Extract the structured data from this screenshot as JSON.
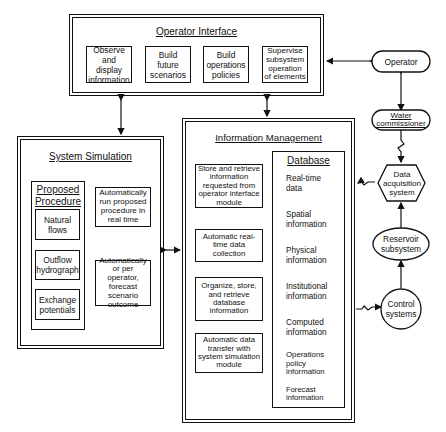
{
  "operator_interface": {
    "title": "Operator Interface",
    "boxes": [
      {
        "label": "Observe and display information"
      },
      {
        "label": "Build future scenarios"
      },
      {
        "label": "Build operations policies"
      },
      {
        "label": "Supervise subsystem operation of elements"
      }
    ]
  },
  "system_simulation": {
    "title": "System Simulation",
    "proposed_procedure": {
      "title_line1": "Proposed",
      "title_line2": "Procedure",
      "items": [
        {
          "label": "Natural flows"
        },
        {
          "label": "Outflow hydrograph"
        },
        {
          "label": "Exchange potentials"
        }
      ]
    },
    "actions": [
      {
        "label": "Automatically run proposed procedure in real time"
      },
      {
        "label": "Automatically or per operator, forecast scenario outcome"
      }
    ]
  },
  "information_management": {
    "title": "Information Management",
    "functions": [
      {
        "label": "Store and retrieve information requested from operator interface module"
      },
      {
        "label": "Automatic real-time data collection"
      },
      {
        "label": "Organize, store, and retrieve database information"
      },
      {
        "label": "Automatic data transfer with system simulation module"
      }
    ],
    "database": {
      "title": "Database",
      "stores": [
        {
          "label": "Real-time data"
        },
        {
          "label": "Spatial information"
        },
        {
          "label": "Physical information"
        },
        {
          "label": "Institutional information"
        },
        {
          "label": "Computed information"
        },
        {
          "label": "Operations policy information"
        },
        {
          "label": "Forecast information"
        }
      ]
    }
  },
  "external": {
    "operator": "Operator",
    "water_commissioner": "Water commissioner",
    "data_acquisition": "Data acquisition system",
    "reservoir": "Reservoir subsystem",
    "control": "Control systems"
  }
}
